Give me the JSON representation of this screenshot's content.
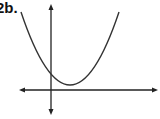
{
  "problem": {
    "label": "2b."
  },
  "graph": {
    "type": "parabola",
    "opens": "up",
    "vertex_quadrant": "I",
    "y_intercept": "positive",
    "stroke_color": "#333333",
    "axis_color": "#222222"
  }
}
